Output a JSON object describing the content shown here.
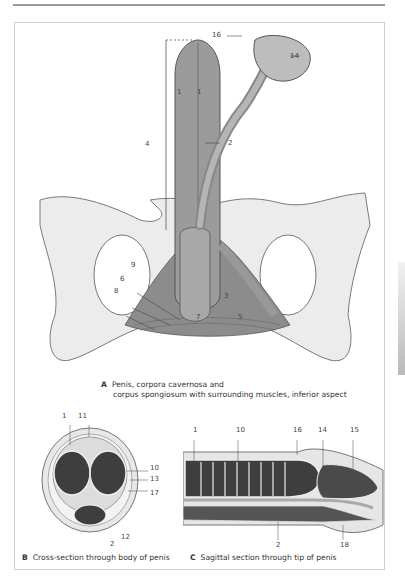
{
  "page": {
    "header_text": "Urinary Tract & Genitals",
    "side_tab_color": "#b9b9b9"
  },
  "figure_a": {
    "letter": "A",
    "caption_line1": "Penis, corpora cavernosa and",
    "caption_line2": "corpus spongiosum with surrounding muscles, inferior aspect",
    "labels": {
      "l16": "16",
      "l14": "14",
      "l1a": "1",
      "l1b": "1",
      "l4": "4",
      "l2": "2",
      "l9": "9",
      "l6": "6",
      "l8": "8",
      "l3": "3",
      "l7": "7",
      "l5": "5"
    }
  },
  "figure_b": {
    "letter": "B",
    "caption": "Cross-section through body of penis",
    "labels": {
      "l1": "1",
      "l11": "11",
      "l10": "10",
      "l13": "13",
      "l17": "17",
      "l12": "12",
      "l2": "2"
    }
  },
  "figure_c": {
    "letter": "C",
    "caption": "Sagittal section through tip of penis",
    "labels": {
      "l1": "1",
      "l10": "10",
      "l16": "16",
      "l14": "14",
      "l15": "15",
      "l2": "2",
      "l18": "18"
    }
  }
}
